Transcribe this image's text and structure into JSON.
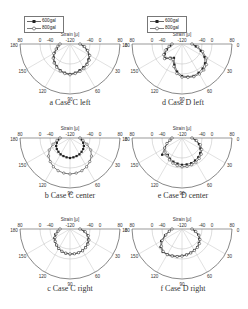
{
  "figure": {
    "axis_label": "Strain [μ]",
    "radial_ticks_left_to_right": [
      "80",
      "0",
      "-40",
      "-120",
      "-40",
      "0",
      "80"
    ],
    "angle_labels": [
      "0",
      "30",
      "60",
      "90",
      "120",
      "150",
      "180"
    ],
    "legend": [
      {
        "label": "600gal",
        "marker": "filled-square",
        "color": "#222222"
      },
      {
        "label": "800gal",
        "marker": "open-circle",
        "color": "#444444"
      }
    ],
    "colors": {
      "axis": "#555555",
      "grid": "#bbbbbb",
      "series": "#222222"
    }
  },
  "panels": [
    {
      "id": "a",
      "caption": "a Case C left",
      "cx": 70,
      "cy": 44
    },
    {
      "id": "b",
      "caption": "b Case C center",
      "cx": 70,
      "cy": 138
    },
    {
      "id": "c",
      "caption": "c Case C right",
      "cx": 70,
      "cy": 229
    },
    {
      "id": "d",
      "caption": "d Case D left",
      "cx": 182,
      "cy": 44
    },
    {
      "id": "e",
      "caption": "e Case D center",
      "cx": 182,
      "cy": 138
    },
    {
      "id": "f",
      "caption": "f Case D right",
      "cx": 182,
      "cy": 229
    }
  ],
  "chart_data": [
    {
      "type": "polar-line",
      "title": "a Case C left",
      "radial_label": "Strain [μ]",
      "rlim": [
        -120,
        80
      ],
      "theta_range_deg": [
        0,
        180
      ],
      "angles": [
        0,
        10,
        20,
        30,
        40,
        50,
        60,
        70,
        80,
        90,
        100,
        110,
        120,
        130,
        140,
        150,
        160,
        170,
        180
      ],
      "series": [
        {
          "name": "600gal",
          "values": [
            0,
            10,
            20,
            30,
            35,
            40,
            42,
            45,
            48,
            50,
            48,
            45,
            40,
            35,
            28,
            20,
            10,
            5,
            0
          ]
        },
        {
          "name": "800gal",
          "values": [
            0,
            12,
            22,
            32,
            38,
            42,
            45,
            48,
            50,
            52,
            50,
            47,
            42,
            37,
            30,
            22,
            12,
            6,
            0
          ]
        }
      ]
    },
    {
      "type": "polar-line",
      "title": "b Case C center",
      "radial_label": "Strain [μ]",
      "rlim": [
        -120,
        80
      ],
      "theta_range_deg": [
        0,
        180
      ],
      "angles": [
        0,
        10,
        20,
        30,
        40,
        50,
        60,
        70,
        80,
        90,
        100,
        110,
        120,
        130,
        140,
        150,
        160,
        170,
        180
      ],
      "series": [
        {
          "name": "600gal",
          "values": [
            0,
            5,
            10,
            15,
            18,
            20,
            22,
            23,
            24,
            25,
            24,
            23,
            22,
            20,
            18,
            15,
            10,
            5,
            0
          ]
        },
        {
          "name": "800gal",
          "values": [
            0,
            8,
            20,
            35,
            45,
            52,
            58,
            62,
            64,
            65,
            64,
            62,
            58,
            52,
            45,
            35,
            20,
            8,
            0
          ]
        }
      ]
    },
    {
      "type": "polar-line",
      "title": "c Case C right",
      "radial_label": "Strain [μ]",
      "rlim": [
        -120,
        80
      ],
      "theta_range_deg": [
        0,
        180
      ],
      "angles": [
        0,
        10,
        20,
        30,
        40,
        50,
        60,
        70,
        80,
        90,
        100,
        110,
        120,
        130,
        140,
        150,
        160,
        170,
        180
      ],
      "series": [
        {
          "name": "600gal",
          "values": [
            0,
            12,
            22,
            28,
            32,
            35,
            37,
            38,
            38,
            38,
            37,
            35,
            32,
            28,
            24,
            20,
            14,
            6,
            0
          ]
        },
        {
          "name": "800gal",
          "values": [
            0,
            14,
            24,
            30,
            34,
            36,
            38,
            38,
            38,
            37,
            36,
            34,
            31,
            27,
            23,
            18,
            12,
            5,
            0
          ]
        }
      ]
    },
    {
      "type": "polar-line",
      "title": "d Case D left",
      "radial_label": "Strain [μ]",
      "rlim": [
        -120,
        80
      ],
      "theta_range_deg": [
        0,
        180
      ],
      "angles": [
        0,
        10,
        20,
        30,
        40,
        50,
        60,
        70,
        80,
        90,
        100,
        110,
        120,
        130,
        140,
        150,
        160,
        170,
        180
      ],
      "series": [
        {
          "name": "600gal",
          "values": [
            0,
            10,
            25,
            40,
            50,
            55,
            58,
            60,
            58,
            55,
            45,
            30,
            15,
            20,
            30,
            25,
            15,
            5,
            0
          ]
        },
        {
          "name": "800gal",
          "values": [
            0,
            15,
            30,
            45,
            55,
            60,
            62,
            62,
            60,
            58,
            50,
            35,
            20,
            22,
            32,
            28,
            18,
            8,
            0
          ]
        }
      ]
    },
    {
      "type": "polar-line",
      "title": "e Case D center",
      "radial_label": "Strain [μ]",
      "rlim": [
        -120,
        80
      ],
      "theta_range_deg": [
        0,
        180
      ],
      "angles": [
        0,
        10,
        20,
        30,
        40,
        50,
        60,
        70,
        80,
        90,
        100,
        110,
        120,
        130,
        140,
        150,
        160,
        170,
        180
      ],
      "series": [
        {
          "name": "600gal",
          "values": [
            0,
            10,
            20,
            28,
            34,
            38,
            40,
            42,
            42,
            42,
            40,
            38,
            35,
            30,
            40,
            25,
            15,
            5,
            0
          ]
        },
        {
          "name": "800gal",
          "values": [
            0,
            12,
            24,
            32,
            38,
            42,
            45,
            46,
            47,
            47,
            45,
            42,
            38,
            33,
            30,
            25,
            15,
            6,
            0
          ]
        }
      ]
    },
    {
      "type": "polar-line",
      "title": "f Case D right",
      "radial_label": "Strain [μ]",
      "rlim": [
        -120,
        80
      ],
      "theta_range_deg": [
        0,
        180
      ],
      "angles": [
        0,
        10,
        20,
        30,
        40,
        50,
        60,
        70,
        80,
        90,
        100,
        110,
        120,
        130,
        140,
        150,
        160,
        170,
        180
      ],
      "series": [
        {
          "name": "600gal",
          "values": [
            0,
            8,
            18,
            25,
            30,
            34,
            36,
            38,
            40,
            42,
            44,
            46,
            48,
            50,
            45,
            35,
            20,
            8,
            0
          ]
        },
        {
          "name": "800gal",
          "values": [
            0,
            10,
            20,
            27,
            32,
            35,
            37,
            39,
            41,
            43,
            45,
            47,
            49,
            48,
            42,
            32,
            18,
            7,
            0
          ]
        }
      ]
    }
  ]
}
